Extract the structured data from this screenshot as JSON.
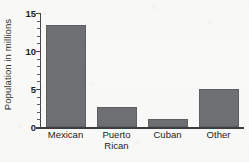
{
  "chart_data": {
    "type": "bar",
    "title": "",
    "subtitle": "",
    "xlabel": "",
    "ylabel": "Population in millions",
    "categories": [
      "Mexican",
      "Puerto Rican",
      "Cuban",
      "Other"
    ],
    "category_lines": [
      [
        "Mexican"
      ],
      [
        "Puerto",
        "Rican"
      ],
      [
        "Cuban"
      ],
      [
        "Other"
      ]
    ],
    "values": [
      13.4,
      2.6,
      1.0,
      5.0
    ],
    "ylim": [
      0,
      15
    ],
    "ytick_labels": [
      "0",
      "5",
      "10",
      "15"
    ],
    "ytick_values": [
      0,
      5,
      10,
      15
    ],
    "yminor_step": 1,
    "grid": false,
    "legend": false,
    "legend_position": "none",
    "bar_color": "#6e7073",
    "axis_color": "#3b3e41",
    "background_color": "#fafaf8",
    "text_color": "#232323"
  }
}
